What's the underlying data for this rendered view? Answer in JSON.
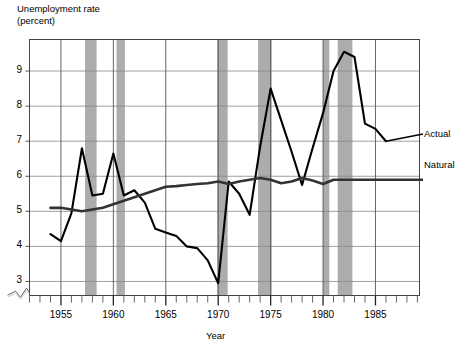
{
  "chart_data": {
    "type": "line",
    "title": "",
    "ylabel": "Unemployment rate\n(percent)",
    "xlabel": "Year",
    "ylim": [
      2.6,
      9.9
    ],
    "xlim": [
      1952.0,
      1989.2
    ],
    "grid": true,
    "y_ticks": [
      3,
      4,
      5,
      6,
      7,
      8,
      9
    ],
    "x_ticks": [
      1955,
      1960,
      1965,
      1970,
      1975,
      1980,
      1985
    ],
    "x_minor_tick_interval": 1,
    "y_axis_break": true,
    "legend_position": "right-inline",
    "series": [
      {
        "name": "Actual",
        "color": "#000000",
        "x": [
          1954,
          1955,
          1956,
          1957,
          1958,
          1959,
          1960,
          1961,
          1962,
          1963,
          1964,
          1965,
          1966,
          1967,
          1968,
          1969,
          1970,
          1971,
          1972,
          1973,
          1974,
          1975,
          1976,
          1977,
          1978,
          1979,
          1980,
          1981,
          1982,
          1983,
          1984,
          1985,
          1986
        ],
        "values": [
          4.35,
          4.15,
          4.95,
          6.8,
          5.45,
          5.5,
          6.65,
          5.45,
          5.6,
          5.25,
          4.5,
          4.4,
          4.3,
          4.0,
          3.95,
          3.6,
          2.95,
          5.85,
          5.5,
          4.9,
          6.85,
          8.5,
          7.6,
          6.7,
          5.75,
          6.8,
          7.8,
          9.0,
          9.55,
          9.4,
          7.5,
          7.35,
          7.0
        ]
      },
      {
        "name": "Natural",
        "color": "#333333",
        "x": [
          1954,
          1955,
          1956,
          1957,
          1958,
          1959,
          1960,
          1961,
          1962,
          1963,
          1964,
          1965,
          1966,
          1967,
          1968,
          1969,
          1970,
          1971,
          1972,
          1973,
          1974,
          1975,
          1976,
          1977,
          1978,
          1979,
          1980,
          1981,
          1982,
          1983,
          1984,
          1985,
          1986
        ],
        "values": [
          5.1,
          5.1,
          5.05,
          5.0,
          5.05,
          5.1,
          5.2,
          5.3,
          5.4,
          5.5,
          5.6,
          5.7,
          5.72,
          5.75,
          5.78,
          5.8,
          5.85,
          5.78,
          5.85,
          5.9,
          5.95,
          5.9,
          5.8,
          5.85,
          5.95,
          5.88,
          5.78,
          5.9,
          5.9,
          5.9,
          5.9,
          5.9,
          5.9
        ]
      }
    ],
    "shaded_bands": {
      "label": "recession-bands",
      "color": "#9e9e9e",
      "ranges": [
        [
          1957.3,
          1958.4
        ],
        [
          1960.3,
          1961.1
        ],
        [
          1969.9,
          1970.9
        ],
        [
          1973.8,
          1975.1
        ],
        [
          1980.0,
          1980.6
        ],
        [
          1981.4,
          1982.8
        ]
      ]
    },
    "series_labels": {
      "actual": "Actual",
      "natural": "Natural"
    },
    "ytick_labels": [
      "9",
      "8",
      "7",
      "6",
      "5",
      "4",
      "3"
    ],
    "xtick_labels": [
      "1955",
      "1960",
      "1965",
      "1970",
      "1975",
      "1980",
      "1985"
    ]
  }
}
